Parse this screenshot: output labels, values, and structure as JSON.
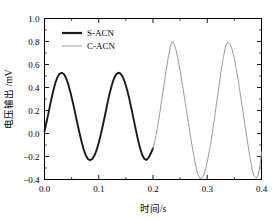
{
  "chart_data": {
    "type": "line",
    "title": "",
    "xlabel": "时间/s",
    "ylabel": "电压输出 /mV",
    "xlim": [
      0.0,
      0.4
    ],
    "ylim": [
      -0.4,
      1.0
    ],
    "xticks": [
      "0.0",
      "0.1",
      "0.2",
      "0.3",
      "0.4"
    ],
    "xtick_values": [
      0.0,
      0.1,
      0.2,
      0.3,
      0.4
    ],
    "xminor_values": [
      0.05,
      0.15,
      0.25,
      0.35
    ],
    "yticks": [
      "1.0",
      "0.8",
      "0.6",
      "0.4",
      "0.2",
      "0.0",
      "-0.2",
      "-0.4"
    ],
    "ytick_values": [
      1.0,
      0.8,
      0.6,
      0.4,
      0.2,
      0.0,
      -0.2,
      -0.4
    ],
    "yminor_values": [
      0.9,
      0.7,
      0.5,
      0.3,
      0.1,
      -0.1,
      -0.3
    ],
    "grid": false,
    "legend_position": "top-left",
    "series": [
      {
        "name": "S-ACN",
        "color": "#1a1a1a",
        "linewidth": 1.9,
        "x": [
          0.0,
          0.004,
          0.008,
          0.012,
          0.016,
          0.02,
          0.024,
          0.028,
          0.032,
          0.036,
          0.04,
          0.044,
          0.048,
          0.052,
          0.056,
          0.06,
          0.064,
          0.068,
          0.072,
          0.076,
          0.08,
          0.084,
          0.088,
          0.092,
          0.096,
          0.1,
          0.104,
          0.108,
          0.112,
          0.116,
          0.12,
          0.124,
          0.128,
          0.132,
          0.136,
          0.14,
          0.144,
          0.148,
          0.152,
          0.156,
          0.16,
          0.164,
          0.168,
          0.172,
          0.176,
          0.18,
          0.184,
          0.188,
          0.192,
          0.196,
          0.2
        ],
        "y": [
          0.02,
          0.105,
          0.195,
          0.285,
          0.37,
          0.44,
          0.492,
          0.521,
          0.528,
          0.515,
          0.48,
          0.425,
          0.355,
          0.275,
          0.19,
          0.1,
          0.015,
          -0.065,
          -0.135,
          -0.19,
          -0.222,
          -0.232,
          -0.222,
          -0.192,
          -0.145,
          -0.08,
          -0.005,
          0.08,
          0.17,
          0.262,
          0.348,
          0.42,
          0.478,
          0.515,
          0.528,
          0.522,
          0.495,
          0.448,
          0.385,
          0.308,
          0.222,
          0.132,
          0.04,
          -0.048,
          -0.125,
          -0.185,
          -0.22,
          -0.23,
          -0.21,
          -0.172,
          -0.128
        ]
      },
      {
        "name": "C-ACN",
        "color": "#9a9a9a",
        "linewidth": 1.0,
        "x": [
          0.2,
          0.204,
          0.208,
          0.212,
          0.216,
          0.22,
          0.224,
          0.228,
          0.232,
          0.235,
          0.238,
          0.242,
          0.246,
          0.25,
          0.254,
          0.258,
          0.262,
          0.266,
          0.27,
          0.274,
          0.278,
          0.282,
          0.286,
          0.29,
          0.294,
          0.298,
          0.302,
          0.306,
          0.31,
          0.314,
          0.318,
          0.322,
          0.326,
          0.33,
          0.334,
          0.338,
          0.342,
          0.346,
          0.35,
          0.354,
          0.358,
          0.362,
          0.366,
          0.37,
          0.374,
          0.378,
          0.382,
          0.386,
          0.39,
          0.394,
          0.398,
          0.4
        ],
        "y": [
          -0.128,
          -0.055,
          0.045,
          0.16,
          0.29,
          0.415,
          0.545,
          0.66,
          0.755,
          0.8,
          0.79,
          0.735,
          0.65,
          0.545,
          0.43,
          0.31,
          0.19,
          0.07,
          -0.05,
          -0.16,
          -0.265,
          -0.345,
          -0.388,
          -0.39,
          -0.355,
          -0.29,
          -0.2,
          -0.095,
          0.025,
          0.155,
          0.29,
          0.425,
          0.555,
          0.67,
          0.762,
          0.795,
          0.782,
          0.73,
          0.65,
          0.548,
          0.432,
          0.31,
          0.185,
          0.06,
          -0.065,
          -0.185,
          -0.295,
          -0.37,
          -0.388,
          -0.36,
          -0.255,
          -0.16
        ]
      }
    ],
    "legend": [
      {
        "label": "S-ACN",
        "color": "#1a1a1a",
        "linewidth": 2.2
      },
      {
        "label": "C-ACN",
        "color": "#9a9a9a",
        "linewidth": 1.0
      }
    ]
  }
}
